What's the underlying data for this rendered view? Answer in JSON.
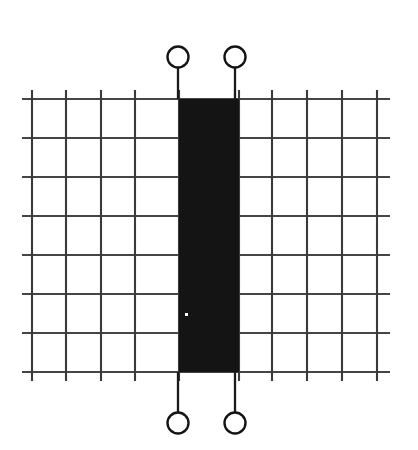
{
  "figure": {
    "canvas": {
      "width": 418,
      "height": 450,
      "background": "#ffffff"
    },
    "colors": {
      "background": "#ffffff",
      "grid": "#3a3a3a",
      "grid_horizontal": "#454545",
      "body": "#141414",
      "lead": "#1a1a1a",
      "terminal_fill": "#ffffff",
      "terminal_stroke": "#141414"
    }
  },
  "grid": {
    "label": "background-grid",
    "vertical_count": 10,
    "horizontal_count": 8,
    "vertical_x": [
      32,
      66,
      101,
      135,
      179,
      239,
      272,
      307,
      342,
      377
    ],
    "horizontal_y": [
      99,
      138,
      177,
      216,
      255,
      294,
      333,
      372
    ],
    "vertical_top": 90,
    "vertical_bottom": 381,
    "horizontal_left": 22,
    "horizontal_right": 390,
    "cell_width": 34,
    "cell_height": 39
  },
  "body": {
    "label": "shunt-body",
    "shape": "rectangle",
    "fill": "#141414",
    "x": 179,
    "y": 99,
    "width": 60,
    "height": 273
  },
  "speck": {
    "label": "print-artifact",
    "x": 185,
    "y": 313,
    "width": 3,
    "height": 3
  },
  "terminals": [
    {
      "name": "terminal-top-left",
      "position": "top-left",
      "circle": {
        "cx": 178,
        "cy": 57,
        "r": 10.5
      },
      "lead": {
        "x1": 178,
        "y1": 67.5,
        "x2": 178,
        "y2": 99
      }
    },
    {
      "name": "terminal-top-right",
      "position": "top-right",
      "circle": {
        "cx": 235,
        "cy": 57,
        "r": 10.5
      },
      "lead": {
        "x1": 235,
        "y1": 67.5,
        "x2": 235,
        "y2": 99
      }
    },
    {
      "name": "terminal-bottom-left",
      "position": "bottom-left",
      "circle": {
        "cx": 178,
        "cy": 423,
        "r": 10.5
      },
      "lead": {
        "x1": 178,
        "y1": 372,
        "x2": 178,
        "y2": 412.5
      }
    },
    {
      "name": "terminal-bottom-right",
      "position": "bottom-right",
      "circle": {
        "cx": 235,
        "cy": 423,
        "r": 10.5
      },
      "lead": {
        "x1": 235,
        "y1": 372,
        "x2": 235,
        "y2": 412.5
      }
    }
  ]
}
